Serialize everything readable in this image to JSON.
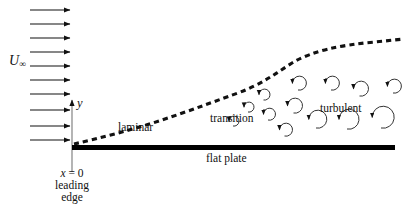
{
  "figure": {
    "background_color": "#ffffff",
    "ink_color": "#111111",
    "plate_color": "#000000"
  },
  "labels": {
    "freestream": "U",
    "freestream_subscript": "∞",
    "y_axis": "y",
    "origin_x": "x",
    "origin_equals": " = 0",
    "origin_line2": "leading",
    "origin_line3": "edge",
    "laminar": "laminar",
    "transition": "transition",
    "turbulent": "turbulent",
    "flat_plate": "flat plate"
  },
  "diagram_data": {
    "type": "schematic",
    "description": "Uniform freestream flow approaches a flat plate; boundary layer thickness grows from laminar through transition to turbulent, indicated by a dashed edge curve and eddy swirls.",
    "freestream_arrows": {
      "count": 7,
      "x_start": 30,
      "x_end": 72,
      "y_values": [
        10,
        24,
        38,
        52,
        66,
        80,
        94,
        108,
        132
      ],
      "direction": "rightward"
    },
    "plate": {
      "x_start": 72,
      "x_end": 395,
      "y_top": 145,
      "thickness": 5
    },
    "y_axis": {
      "x": 72,
      "y_top": 100,
      "y_bottom": 172,
      "arrow": "up"
    },
    "boundary_layer_curve": {
      "style": "dashed",
      "points": [
        [
          74,
          144
        ],
        [
          100,
          136
        ],
        [
          130,
          128
        ],
        [
          160,
          120
        ],
        [
          190,
          112
        ],
        [
          215,
          101
        ],
        [
          240,
          93
        ],
        [
          262,
          84
        ],
        [
          285,
          70
        ],
        [
          305,
          58
        ],
        [
          325,
          50
        ],
        [
          350,
          45
        ],
        [
          375,
          42
        ],
        [
          403,
          39
        ]
      ]
    },
    "eddies": [
      {
        "cx": 228,
        "cy": 126,
        "r": 5,
        "region": "transition"
      },
      {
        "cx": 243,
        "cy": 112,
        "r": 5,
        "region": "transition"
      },
      {
        "cx": 262,
        "cy": 120,
        "r": 6,
        "region": "transition"
      },
      {
        "cx": 258,
        "cy": 100,
        "r": 5.5,
        "region": "transition"
      },
      {
        "cx": 278,
        "cy": 136,
        "r": 6.5,
        "region": "transition"
      },
      {
        "cx": 286,
        "cy": 113,
        "r": 7.5,
        "region": "turbulent"
      },
      {
        "cx": 291,
        "cy": 90,
        "r": 7,
        "region": "turbulent"
      },
      {
        "cx": 307,
        "cy": 128,
        "r": 9,
        "region": "turbulent"
      },
      {
        "cx": 324,
        "cy": 90,
        "r": 7,
        "region": "turbulent"
      },
      {
        "cx": 337,
        "cy": 129,
        "r": 10,
        "region": "turbulent"
      },
      {
        "cx": 352,
        "cy": 96,
        "r": 7.5,
        "region": "turbulent"
      },
      {
        "cx": 370,
        "cy": 128,
        "r": 11,
        "region": "turbulent"
      },
      {
        "cx": 386,
        "cy": 93,
        "r": 7,
        "region": "turbulent"
      }
    ]
  }
}
